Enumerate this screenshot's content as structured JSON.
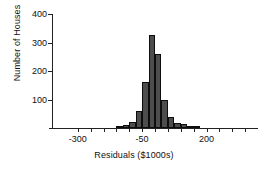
{
  "chart_data": {
    "type": "bar",
    "title": "",
    "subtitle": "",
    "xlabel": "Residuals ($1000s)",
    "ylabel": "Number of Houses",
    "xlim": [
      -400,
      400
    ],
    "ylim": [
      0,
      400
    ],
    "grid": false,
    "legend": null,
    "bin_width": 25,
    "y_ticks": [
      100,
      200,
      300,
      400
    ],
    "y_tick_labels": [
      "100",
      "200",
      "300",
      "400"
    ],
    "x_ticks": [
      -300,
      -250,
      -200,
      -150,
      -100,
      -50,
      0,
      50,
      100,
      150,
      200,
      250,
      300,
      350
    ],
    "x_tick_labels": [
      "-300",
      "",
      "",
      "",
      "",
      "-50",
      "",
      "",
      "",
      "",
      "200",
      "",
      "",
      ""
    ],
    "x_labeled_ticks": [
      -300,
      -50,
      200
    ],
    "bins": [
      {
        "x0": -150,
        "x1": -125,
        "center": -137.5,
        "value": 4
      },
      {
        "x0": -125,
        "x1": -100,
        "center": -112.5,
        "value": 10
      },
      {
        "x0": -100,
        "x1": -75,
        "center": -87.5,
        "value": 20
      },
      {
        "x0": -75,
        "x1": -50,
        "center": -62.5,
        "value": 58
      },
      {
        "x0": -50,
        "x1": -25,
        "center": -37.5,
        "value": 162
      },
      {
        "x0": -25,
        "x1": 0,
        "center": -12.5,
        "value": 325
      },
      {
        "x0": 0,
        "x1": 25,
        "center": 12.5,
        "value": 258
      },
      {
        "x0": 25,
        "x1": 50,
        "center": 37.5,
        "value": 98
      },
      {
        "x0": 50,
        "x1": 75,
        "center": 62.5,
        "value": 40
      },
      {
        "x0": 75,
        "x1": 100,
        "center": 87.5,
        "value": 17
      },
      {
        "x0": 100,
        "x1": 125,
        "center": 112.5,
        "value": 14
      },
      {
        "x0": 125,
        "x1": 150,
        "center": 137.5,
        "value": 4
      },
      {
        "x0": 150,
        "x1": 175,
        "center": 162.5,
        "value": 3
      }
    ],
    "colors": {
      "bar_fill": "#4d4d4d",
      "bar_edge": "#0d0d0d",
      "axis": "#222222",
      "background": "#ffffff"
    }
  }
}
